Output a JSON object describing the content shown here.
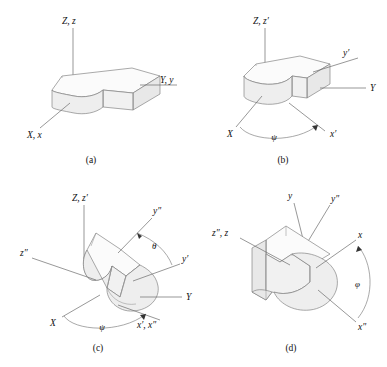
{
  "figure": {
    "background_color": "#ffffff",
    "line_color": "#7c7c7c",
    "text_color": "#111111",
    "panels": [
      {
        "id": "a",
        "caption": "(a)",
        "description": "Body aligned with fixed frame; body axes coincide with space axes",
        "labels": [
          {
            "name": "axis-label-Z-z",
            "text": "Z, z"
          },
          {
            "name": "axis-label-Y-y",
            "text": "Y, y"
          },
          {
            "name": "axis-label-X-x",
            "text": "X, x"
          }
        ],
        "angles": []
      },
      {
        "id": "b",
        "caption": "(b)",
        "description": "First rotation by psi about the Z axis",
        "labels": [
          {
            "name": "axis-label-Z-zprime",
            "text": "Z, z′"
          },
          {
            "name": "axis-label-yprime",
            "text": "y′"
          },
          {
            "name": "axis-label-Y",
            "text": "Y"
          },
          {
            "name": "axis-label-X",
            "text": "X"
          },
          {
            "name": "axis-label-xprime",
            "text": "x′"
          }
        ],
        "angles": [
          {
            "name": "angle-psi",
            "symbol": "ψ",
            "about": "Z"
          }
        ]
      },
      {
        "id": "c",
        "caption": "(c)",
        "description": "Second rotation by theta about the x-prime line of nodes",
        "labels": [
          {
            "name": "axis-label-Z-zprime",
            "text": "Z, z′"
          },
          {
            "name": "axis-label-ydblprime",
            "text": "y″"
          },
          {
            "name": "axis-label-yprime",
            "text": "y′"
          },
          {
            "name": "axis-label-zdblprime",
            "text": "z″"
          },
          {
            "name": "axis-label-Y",
            "text": "Y"
          },
          {
            "name": "axis-label-X",
            "text": "X"
          },
          {
            "name": "axis-label-xprime-xdblprime",
            "text": "x′, x″"
          }
        ],
        "angles": [
          {
            "name": "angle-theta",
            "symbol": "θ",
            "about": "x′"
          },
          {
            "name": "angle-psi",
            "symbol": "ψ",
            "about": "Z"
          }
        ]
      },
      {
        "id": "d",
        "caption": "(d)",
        "description": "Third rotation by phi about the z-double-prime body axis",
        "labels": [
          {
            "name": "axis-label-y",
            "text": "y"
          },
          {
            "name": "axis-label-ydblprime",
            "text": "y″"
          },
          {
            "name": "axis-label-zdblprime-z",
            "text": "z″, z"
          },
          {
            "name": "axis-label-x",
            "text": "x"
          },
          {
            "name": "axis-label-xdblprime",
            "text": "x″"
          }
        ],
        "angles": [
          {
            "name": "angle-phi",
            "symbol": "φ",
            "about": "z″"
          }
        ]
      }
    ]
  }
}
